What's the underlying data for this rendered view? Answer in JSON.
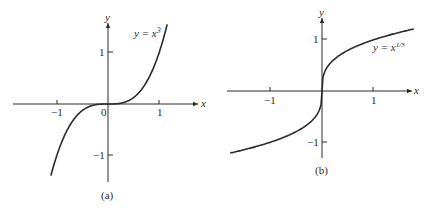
{
  "chart_data": [
    {
      "type": "line",
      "title": "",
      "caption": "(a)",
      "xlabel": "x",
      "ylabel": "y",
      "annotation": "y = x³",
      "equation_base": "y = x",
      "equation_exp": "3",
      "series": [
        {
          "name": "y = x^3",
          "function": "x^3",
          "x": [
            -1.12,
            -1.0,
            -0.75,
            -0.5,
            -0.25,
            0,
            0.25,
            0.5,
            0.75,
            1.0,
            1.16
          ],
          "values": [
            -1.4,
            -1.0,
            -0.42,
            -0.125,
            -0.016,
            0,
            0.016,
            0.125,
            0.42,
            1.0,
            1.56
          ]
        }
      ],
      "x_ticks": [
        "−1",
        "0",
        "1"
      ],
      "y_ticks": [
        "1",
        "−1"
      ],
      "xlim": [
        -1.4,
        1.6
      ],
      "ylim": [
        -1.5,
        1.6
      ],
      "grid": false,
      "legend": "none"
    },
    {
      "type": "line",
      "title": "",
      "caption": "(b)",
      "xlabel": "x",
      "ylabel": "y",
      "annotation": "y = x^1/3",
      "equation_base": "y = x",
      "equation_exp": "1/3",
      "series": [
        {
          "name": "y = x^(1/3)",
          "function": "x^(1/3)",
          "x": [
            -1.8,
            -1.0,
            -0.5,
            -0.125,
            0,
            0.125,
            0.5,
            1.0,
            1.8
          ],
          "values": [
            -1.22,
            -1.0,
            -0.79,
            -0.5,
            0,
            0.5,
            0.79,
            1.0,
            1.22
          ]
        }
      ],
      "x_ticks": [
        "−1",
        "1"
      ],
      "y_ticks": [
        "1",
        "−1"
      ],
      "xlim": [
        -1.8,
        1.9
      ],
      "ylim": [
        -1.3,
        1.4
      ],
      "grid": false,
      "legend": "none"
    }
  ]
}
